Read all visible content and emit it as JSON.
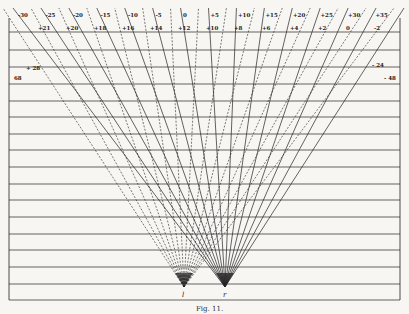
{
  "figure": {
    "caption": "Fig. 11.",
    "eye_left_label": "l",
    "eye_right_label": "r",
    "top_scale_labels": [
      "-30",
      "-25",
      "-20",
      "-15",
      "-10",
      "-5",
      "0",
      "+5",
      "+10",
      "+15",
      "+20",
      "+25",
      "+30",
      "+35"
    ],
    "baseline_labels": [
      "+21",
      "+20",
      "+18",
      "+16",
      "+14",
      "+12",
      "+10",
      "+8",
      "+6",
      "+4",
      "+2",
      "0",
      "-2"
    ],
    "side_labels": {
      "left_upper": "+ 28",
      "left_lower": "68",
      "right_upper": "- 24",
      "right_lower": "- 48"
    },
    "center_marks": [
      "a",
      "b",
      "c"
    ]
  },
  "geometry": {
    "frame": {
      "left": 9,
      "right": 400,
      "top": 32,
      "bottom": 300
    },
    "horizontal_lines_y": [
      32,
      50,
      67,
      84,
      101,
      117,
      134,
      150,
      167,
      184,
      200,
      217,
      234,
      250,
      267,
      284,
      300
    ],
    "apex_left": [
      184,
      287
    ],
    "apex_right": [
      225,
      287
    ],
    "ray_count_per_eye": 15,
    "line_color": "#222222",
    "background": "#f7f6f3"
  }
}
